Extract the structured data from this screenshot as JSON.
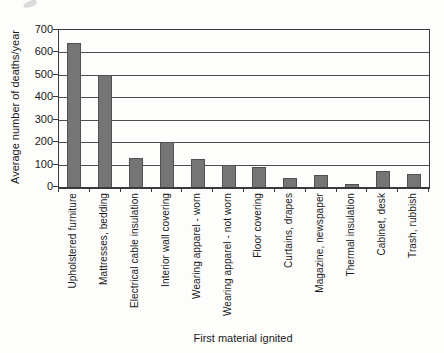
{
  "chart_data": {
    "type": "bar",
    "title": "",
    "xlabel": "First material ignited",
    "ylabel": "Average number of deaths/year",
    "categories": [
      "Upholstered furniture",
      "Mattresses, bedding",
      "Electrical cable insulation",
      "Interior wall covering",
      "Wearing apparel - worn",
      "Wearing apparel - not worn",
      "Floor covering",
      "Curtains, drapes",
      "Magazine, newspaper",
      "Thermal insulation",
      "Cabinet, desk",
      "Trash, rubbish"
    ],
    "values": [
      640,
      500,
      130,
      200,
      125,
      100,
      90,
      40,
      55,
      15,
      70,
      60
    ],
    "ylim": [
      0,
      700
    ],
    "yticks": [
      0,
      100,
      200,
      300,
      400,
      500,
      600,
      700
    ],
    "grid": "horizontal",
    "legend": "none",
    "bar_color": "#757575",
    "bar_border_color": "#515151",
    "gridline_color": "#4d4d4d",
    "axis_color": "#3a3a3a",
    "text_color": "#1a1a1a",
    "background_color": "#fdfdfc"
  }
}
